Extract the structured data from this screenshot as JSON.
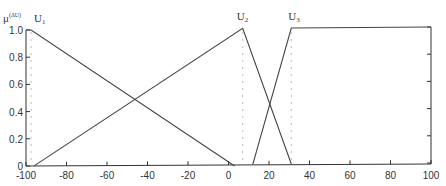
{
  "chart_data": {
    "type": "line",
    "title": "",
    "xlabel": "",
    "ylabel": "μ",
    "ylabel_superscript": "(ΔU)",
    "xlim": [
      -100,
      100
    ],
    "ylim": [
      0,
      1.0
    ],
    "xticks": [
      -100,
      -80,
      -60,
      -40,
      -20,
      0,
      20,
      40,
      60,
      80,
      100
    ],
    "xtick_labels": [
      "-100",
      "-80",
      "-60",
      "-40",
      "-20",
      "0",
      "20",
      "40",
      "60",
      "80",
      "100"
    ],
    "yticks": [
      0,
      0.2,
      0.4,
      0.6,
      0.8,
      1.0
    ],
    "ytick_labels": [
      "0",
      "0.2",
      "0.4",
      "0.6",
      "0.8",
      "1.0"
    ],
    "grid": false,
    "legend": "none",
    "series": [
      {
        "name": "U1",
        "label_main": "U",
        "label_sub": "1",
        "x": [
          -100,
          -97.5,
          3
        ],
        "y": [
          1.0,
          1.0,
          0
        ]
      },
      {
        "name": "U2",
        "label_main": "U",
        "label_sub": "2",
        "x": [
          -96,
          7,
          31
        ],
        "y": [
          0,
          1.0,
          0
        ]
      },
      {
        "name": "U3",
        "label_main": "U",
        "label_sub": "3",
        "x": [
          12,
          31,
          100
        ],
        "y": [
          0,
          1.0,
          1.0
        ]
      }
    ],
    "reference_lines": [
      {
        "orientation": "vertical",
        "style": "dotted",
        "x": -97.5
      },
      {
        "orientation": "vertical",
        "style": "dotted",
        "x": 7
      },
      {
        "orientation": "vertical",
        "style": "dotted",
        "x": 31
      }
    ],
    "colors": {
      "line": "#444444",
      "axis": "#333333",
      "dotted": "#bbbbbb"
    }
  }
}
